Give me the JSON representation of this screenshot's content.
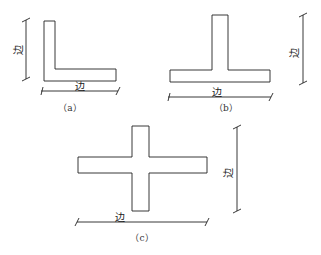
{
  "diagram": {
    "type": "structural cross-sections with dimension lines",
    "dimension_label": "边",
    "figures": [
      {
        "id": "a",
        "caption": "（a）",
        "shape": "L-section",
        "dims": [
          "边 (vertical)",
          "边 (horizontal)"
        ]
      },
      {
        "id": "b",
        "caption": "（b）",
        "shape": "T-section",
        "dims": [
          "边 (horizontal)",
          "边 (vertical)"
        ]
      },
      {
        "id": "c",
        "caption": "（c）",
        "shape": "cross-section",
        "dims": [
          "边 (horizontal)",
          "边 (vertical)"
        ]
      }
    ],
    "colors": {
      "line": "#222222",
      "background": "#ffffff"
    }
  }
}
